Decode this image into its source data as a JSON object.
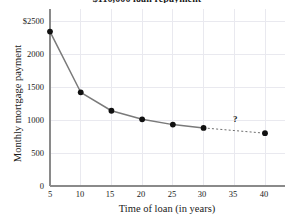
{
  "chart_data": {
    "type": "line",
    "title": "$110,000 loan repayment",
    "xlabel": "Time of loan (in years)",
    "ylabel": "Monthly mortgage payment",
    "x": [
      5,
      10,
      15,
      20,
      25,
      30,
      40
    ],
    "values": [
      2340,
      1420,
      1140,
      1010,
      930,
      880,
      800
    ],
    "series": [
      {
        "name": "Monthly mortgage payment",
        "x": [
          5,
          10,
          15,
          20,
          25,
          30
        ],
        "values": [
          2340,
          1420,
          1140,
          1010,
          930,
          880
        ],
        "style": "solid"
      },
      {
        "name": "Projected (unknown)",
        "x": [
          30,
          40
        ],
        "values": [
          880,
          800
        ],
        "style": "dashed"
      }
    ],
    "xlim": [
      5,
      40
    ],
    "ylim": [
      0,
      2500
    ],
    "xticks": [
      "5",
      "10",
      "15",
      "20",
      "25",
      "30",
      "35",
      "40"
    ],
    "xtick_values": [
      5,
      10,
      15,
      20,
      25,
      30,
      35,
      40
    ],
    "yticks": [
      "0",
      "500",
      "1000",
      "1500",
      "2000",
      "$2500"
    ],
    "ytick_values": [
      0,
      500,
      1000,
      1500,
      2000,
      2500
    ],
    "grid": true,
    "legend": "none",
    "annotations": [
      {
        "text": "?",
        "x": 35,
        "y": 880,
        "name": "unknown-value-marker"
      }
    ],
    "colors": {
      "line": "#7a7a7a",
      "marker": "#111111",
      "grid": "#e9e9ef",
      "axis": "#8a8a8a",
      "text": "#1a1a1a"
    }
  }
}
